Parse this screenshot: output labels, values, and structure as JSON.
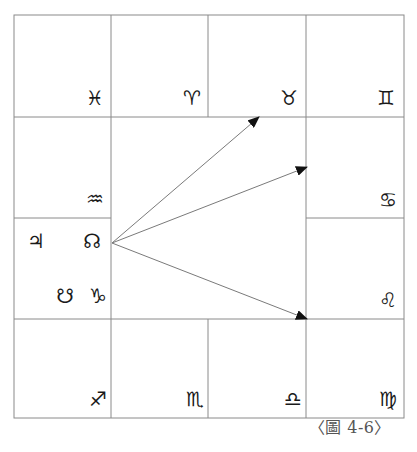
{
  "diagram": {
    "type": "square-horoscope-chart",
    "grid": {
      "x": [
        14,
        111,
        208,
        306,
        404
      ],
      "y": [
        15,
        117,
        218,
        319,
        418
      ]
    },
    "houses": [
      {
        "position": "top-1",
        "sign": "Pisces",
        "glyph": "♓"
      },
      {
        "position": "top-2",
        "sign": "Aries",
        "glyph": "♈"
      },
      {
        "position": "top-3",
        "sign": "Taurus",
        "glyph": "♉"
      },
      {
        "position": "top-4",
        "sign": "Gemini",
        "glyph": "♊"
      },
      {
        "position": "right-2",
        "sign": "Cancer",
        "glyph": "♋"
      },
      {
        "position": "right-3",
        "sign": "Leo",
        "glyph": "♌"
      },
      {
        "position": "bottom-4",
        "sign": "Virgo",
        "glyph": "♍"
      },
      {
        "position": "bottom-3",
        "sign": "Libra",
        "glyph": "♎"
      },
      {
        "position": "bottom-2",
        "sign": "Scorpio",
        "glyph": "♏"
      },
      {
        "position": "bottom-1",
        "sign": "Sagittarius",
        "glyph": "♐"
      },
      {
        "position": "left-3",
        "sign": "Capricorn",
        "glyph": "♑",
        "planets": [
          {
            "name": "Jupiter",
            "glyph": "♃"
          },
          {
            "name": "North Node",
            "glyph": "☊"
          },
          {
            "name": "South Node",
            "glyph": "☋"
          }
        ]
      },
      {
        "position": "left-2",
        "sign": "Aquarius",
        "glyph": "♒"
      }
    ],
    "arrows": {
      "origin": [
        112,
        243
      ],
      "targets": [
        {
          "to_sign": "Taurus",
          "point": [
            259,
            117
          ]
        },
        {
          "to_sign": "Cancer",
          "point": [
            307,
            167
          ]
        },
        {
          "to_sign": "Leo",
          "point": [
            307,
            319
          ]
        }
      ]
    }
  },
  "labels": {
    "pisces": "♓",
    "aries": "♈",
    "taurus": "♉",
    "gemini": "♊",
    "cancer": "♋",
    "leo": "♌",
    "virgo": "♍",
    "libra": "♎",
    "scorpio": "♏",
    "sagittarius": "♐",
    "capricorn": "♑",
    "aquarius": "♒",
    "jupiter": "♃",
    "north_node": "☊",
    "south_node": "☋"
  },
  "caption": "〈圖 4-6〉"
}
